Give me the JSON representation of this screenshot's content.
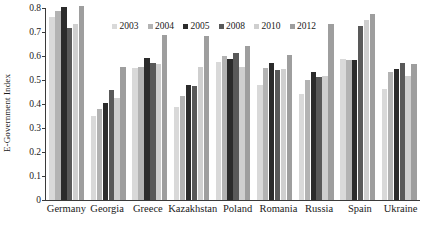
{
  "chart_data": {
    "type": "bar",
    "title": "",
    "xlabel": "",
    "ylabel": "E-Government Index",
    "ylim": [
      0,
      0.8
    ],
    "yticks": [
      "0",
      "0.1",
      "0.2",
      "0.3",
      "0.4",
      "0.5",
      "0.6",
      "0.7",
      "0.8"
    ],
    "ytick_values": [
      0,
      0.1,
      0.2,
      0.3,
      0.4,
      0.5,
      0.6,
      0.7,
      0.8
    ],
    "grid": false,
    "legend_position": "top-center",
    "categories": [
      "Germany",
      "Georgia",
      "Greece",
      "Kazakhstan",
      "Poland",
      "Romania",
      "Russia",
      "Spain",
      "Ukraine"
    ],
    "series": [
      {
        "name": "2003",
        "color": "#d9d9d9",
        "values": [
          0.762,
          0.352,
          0.548,
          0.386,
          0.574,
          0.48,
          0.441,
          0.588,
          0.461
        ]
      },
      {
        "name": "2004",
        "color": "#b3b3b3",
        "values": [
          0.787,
          0.378,
          0.556,
          0.434,
          0.6,
          0.548,
          0.5,
          0.583,
          0.535
        ]
      },
      {
        "name": "2005",
        "color": "#2b2b2b",
        "values": [
          0.805,
          0.403,
          0.591,
          0.481,
          0.587,
          0.57,
          0.532,
          0.584,
          0.545
        ]
      },
      {
        "name": "2008",
        "color": "#595959",
        "values": [
          0.715,
          0.458,
          0.571,
          0.473,
          0.612,
          0.541,
          0.512,
          0.723,
          0.572
        ]
      },
      {
        "name": "2010",
        "color": "#cfcfcf",
        "values": [
          0.733,
          0.426,
          0.568,
          0.556,
          0.556,
          0.546,
          0.515,
          0.75,
          0.516
        ]
      },
      {
        "name": "2012",
        "color": "#9e9e9e",
        "values": [
          0.807,
          0.556,
          0.687,
          0.685,
          0.643,
          0.604,
          0.733,
          0.774,
          0.565
        ]
      }
    ]
  }
}
